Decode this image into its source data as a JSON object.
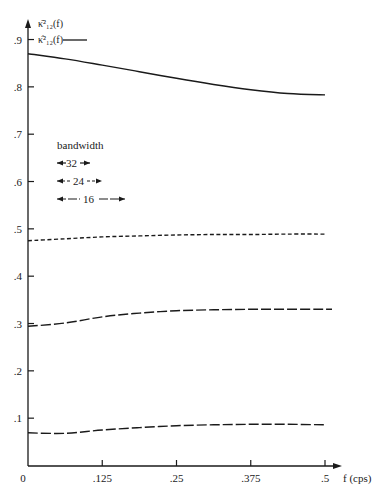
{
  "chart_data": {
    "type": "line",
    "title": "",
    "xlabel": "f (cps)",
    "ylabel_series": [
      "κ̄²₁₂(f)",
      "κ̂²₁₂(f)"
    ],
    "xlim": [
      0,
      0.5
    ],
    "ylim": [
      0,
      0.9
    ],
    "grid": false,
    "x_ticks": [
      "0",
      ".125",
      ".25",
      ".375",
      ".5"
    ],
    "y_ticks": [
      ".1",
      ".2",
      ".3",
      ".4",
      ".5",
      ".6",
      ".7",
      ".8",
      ".9"
    ],
    "x": [
      0,
      0.0625,
      0.125,
      0.1875,
      0.25,
      0.3125,
      0.375,
      0.4375,
      0.5
    ],
    "series": [
      {
        "name": "κ̂²₁₂(f)",
        "style": "solid",
        "values": [
          0.87,
          0.859,
          0.846,
          0.832,
          0.818,
          0.805,
          0.794,
          0.786,
          0.783
        ]
      },
      {
        "name": "bandwidth 24",
        "style": "short-dash",
        "values": [
          0.475,
          0.479,
          0.483,
          0.485,
          0.487,
          0.488,
          0.488,
          0.489,
          0.489
        ]
      },
      {
        "name": "bandwidth 16",
        "style": "long-dash",
        "values": [
          0.294,
          0.301,
          0.314,
          0.322,
          0.327,
          0.329,
          0.33,
          0.33,
          0.33
        ]
      },
      {
        "name": "bandwidth 16 (lower)",
        "style": "long-dash",
        "values": [
          0.069,
          0.068,
          0.075,
          0.08,
          0.084,
          0.086,
          0.087,
          0.087,
          0.086
        ]
      }
    ],
    "legend": {
      "title": "bandwidth",
      "entries": [
        {
          "label": "32",
          "style": "solid"
        },
        {
          "label": "24",
          "style": "short-dash"
        },
        {
          "label": "16",
          "style": "long-dash-dot"
        }
      ],
      "position": "upper-left"
    },
    "annotations": [
      {
        "text": "κ̄²₁₂(f)",
        "position": "top of y-axis"
      },
      {
        "text": "κ̂²₁₂(f) ——",
        "position": "beside .9 tick"
      }
    ]
  },
  "axes": {
    "x_label": "f (cps)",
    "y_label_top": "κ̄²₁₂(f)",
    "y_label_second": "κ̂²₁₂(f)"
  },
  "legend": {
    "title": "bandwidth",
    "bw32": "32",
    "bw24": "24",
    "bw16": "16"
  }
}
